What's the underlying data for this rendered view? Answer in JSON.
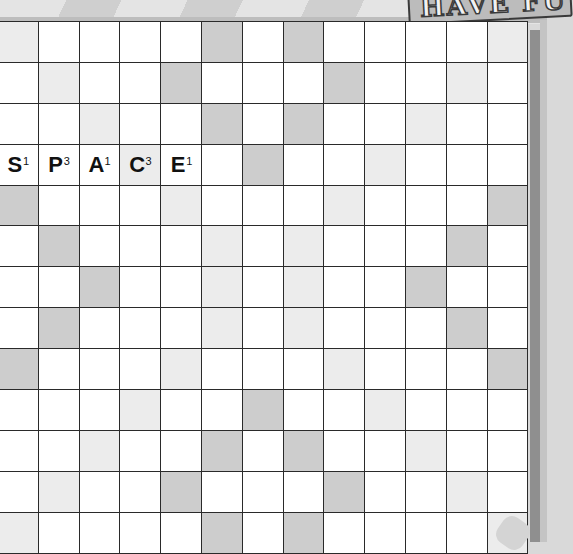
{
  "logo": {
    "text": "HAVE FU",
    "partially_visible": true
  },
  "board": {
    "rows": 13,
    "cols": 13,
    "colors": {
      "normal": "#ffffff",
      "dark": "#cdcdcd",
      "light": "#ececec",
      "grid_line": "#2a2a2a"
    },
    "premium_squares": [
      {
        "row": 0,
        "dark": [
          5,
          7
        ],
        "light": [
          0,
          12
        ]
      },
      {
        "row": 1,
        "dark": [
          4,
          8
        ],
        "light": [
          1,
          11
        ]
      },
      {
        "row": 2,
        "dark": [
          5,
          7
        ],
        "light": [
          2,
          10
        ]
      },
      {
        "row": 3,
        "dark": [
          6
        ],
        "light": [
          3,
          9
        ]
      },
      {
        "row": 4,
        "dark": [
          0,
          12
        ],
        "light": [
          4,
          8
        ]
      },
      {
        "row": 5,
        "dark": [
          1,
          11
        ],
        "light": [
          5,
          7
        ]
      },
      {
        "row": 6,
        "dark": [
          2,
          10
        ],
        "light": [
          5,
          7
        ]
      },
      {
        "row": 7,
        "dark": [
          1,
          11
        ],
        "light": [
          5,
          7
        ]
      },
      {
        "row": 8,
        "dark": [
          0,
          12
        ],
        "light": [
          4,
          8
        ]
      },
      {
        "row": 9,
        "dark": [
          6
        ],
        "light": [
          3,
          9
        ]
      },
      {
        "row": 10,
        "dark": [
          5,
          7
        ],
        "light": [
          2,
          10
        ]
      },
      {
        "row": 11,
        "dark": [
          4,
          8
        ],
        "light": [
          1,
          11
        ]
      },
      {
        "row": 12,
        "dark": [
          5,
          7
        ],
        "light": [
          0,
          12
        ]
      }
    ],
    "placed_tiles": [
      {
        "row": 3,
        "col": 0,
        "letter": "S",
        "score": "1"
      },
      {
        "row": 3,
        "col": 1,
        "letter": "P",
        "score": "3"
      },
      {
        "row": 3,
        "col": 2,
        "letter": "A",
        "score": "1"
      },
      {
        "row": 3,
        "col": 3,
        "letter": "C",
        "score": "3"
      },
      {
        "row": 3,
        "col": 4,
        "letter": "E",
        "score": "1"
      }
    ],
    "word": "SPACE"
  }
}
